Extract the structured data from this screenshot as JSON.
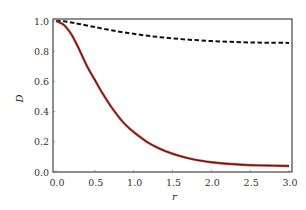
{
  "chart_data": {
    "type": "line",
    "title": "",
    "xlabel": "r",
    "ylabel": "D",
    "xlim": [
      0.0,
      3.0
    ],
    "ylim": [
      0.0,
      1.0
    ],
    "xticks": [
      "0.0",
      "0.5",
      "1.0",
      "1.5",
      "2.0",
      "2.5",
      "3.0"
    ],
    "xtick_values": [
      0.0,
      0.5,
      1.0,
      1.5,
      2.0,
      2.5,
      3.0
    ],
    "yticks": [
      "0.0",
      "0.2",
      "0.4",
      "0.6",
      "0.8",
      "1.0"
    ],
    "ytick_values": [
      0.0,
      0.2,
      0.4,
      0.6,
      0.8,
      1.0
    ],
    "grid": false,
    "legend": null,
    "series": [
      {
        "name": "dashed",
        "color": "#111111",
        "style": "dashed",
        "x": [
          0.0,
          0.1,
          0.2,
          0.3,
          0.5,
          0.75,
          1.0,
          1.25,
          1.5,
          1.75,
          2.0,
          2.25,
          2.5,
          2.75,
          3.0
        ],
        "y": [
          1.0,
          0.998,
          0.99,
          0.98,
          0.96,
          0.935,
          0.915,
          0.898,
          0.885,
          0.875,
          0.867,
          0.862,
          0.858,
          0.856,
          0.855
        ]
      },
      {
        "name": "solid-red",
        "color": "#c0392b",
        "overlay_color": "#3a1a1a",
        "style": "solid",
        "x": [
          0.0,
          0.1,
          0.2,
          0.3,
          0.4,
          0.5,
          0.6,
          0.7,
          0.8,
          0.9,
          1.0,
          1.2,
          1.4,
          1.6,
          1.8,
          2.0,
          2.2,
          2.4,
          2.6,
          2.8,
          3.0
        ],
        "y": [
          1.0,
          0.975,
          0.91,
          0.81,
          0.7,
          0.61,
          0.52,
          0.44,
          0.37,
          0.31,
          0.265,
          0.19,
          0.14,
          0.105,
          0.08,
          0.065,
          0.055,
          0.048,
          0.044,
          0.042,
          0.04
        ]
      }
    ]
  }
}
